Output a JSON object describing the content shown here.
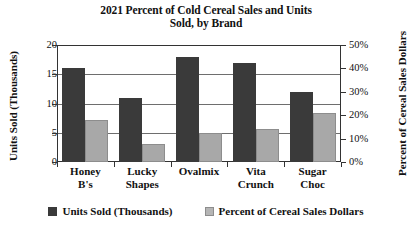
{
  "chart_data": {
    "type": "bar",
    "title": "2021 Percent of Cold Cereal Sales and Units Sold, by Brand",
    "title_line1": "2021 Percent of Cold Cereal Sales and Units",
    "title_line2": "Sold, by Brand",
    "categories": [
      "Honey B's",
      "Lucky Shapes",
      "Ovalmix",
      "Vita Crunch",
      "Sugar Choc"
    ],
    "category_lines": [
      [
        "Honey",
        "B's"
      ],
      [
        "Lucky",
        "Shapes"
      ],
      [
        "Ovalmix",
        ""
      ],
      [
        "Vita",
        "Crunch"
      ],
      [
        "Sugar",
        "Choc"
      ]
    ],
    "series": [
      {
        "name": "Units Sold (Thousands)",
        "axis": "left",
        "color": "#3a3a3a",
        "values": [
          16,
          11,
          18,
          17,
          12
        ]
      },
      {
        "name": "Percent of Cereal Sales Dollars",
        "axis": "right",
        "color": "#a8a8a8",
        "values": [
          18,
          7.5,
          12.5,
          14,
          21
        ]
      }
    ],
    "xlabel": "",
    "ylabel": "Units Sold (Thousands)",
    "y2label": "Percent of Cereal Sales Dollars",
    "ylim": [
      0,
      20
    ],
    "y2lim": [
      0,
      50
    ],
    "yticks": [
      "20",
      "15",
      "10",
      "5",
      "0"
    ],
    "y2ticks": [
      "50%",
      "40%",
      "30%",
      "20%",
      "10%",
      "0%"
    ],
    "ytick_values": [
      20,
      15,
      10,
      5,
      0
    ],
    "y2tick_values": [
      50,
      40,
      30,
      20,
      10,
      0
    ],
    "grid": true,
    "legend_position": "bottom",
    "legend": [
      "Units Sold (Thousands)",
      "Percent of Cereal Sales Dollars"
    ]
  }
}
